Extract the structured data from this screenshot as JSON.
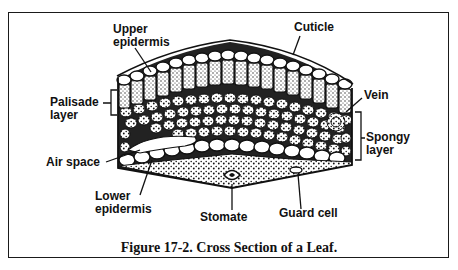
{
  "figure": {
    "caption": "Figure 17-2.  Cross Section of a Leaf."
  },
  "labels": {
    "upper_epidermis": [
      "Upper",
      "epidermis"
    ],
    "cuticle": "Cuticle",
    "palisade_layer": [
      "Palisade",
      "layer"
    ],
    "vein": "Vein",
    "spongy_layer": [
      "Spongy",
      "layer"
    ],
    "air_space": "Air space",
    "lower_epidermis": [
      "Lower",
      "epidermis"
    ],
    "stomate": "Stomate",
    "guard_cell": "Guard cell"
  },
  "colors": {
    "ink": "#111111",
    "background": "#ffffff",
    "stipple": "#555555"
  }
}
